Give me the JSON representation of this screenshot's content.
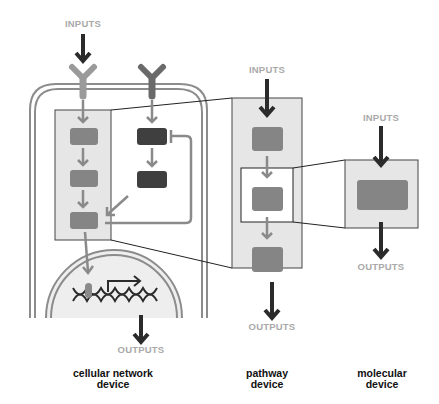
{
  "labels": {
    "cell_inputs": "INPUTS",
    "cell_outputs": "OUTPUTS",
    "pathway_inputs": "INPUTS",
    "pathway_outputs": "OUTPUTS",
    "molecular_inputs": "INPUTS",
    "molecular_outputs": "OUTPUTS"
  },
  "devices": {
    "cellular_line1": "cellular network",
    "cellular_line2": "device",
    "pathway_line1": "pathway",
    "pathway_line2": "device",
    "molecular_line1": "molecular",
    "molecular_line2": "device"
  },
  "colors": {
    "dark_arrow": "#2b2b2b",
    "gray_arrow": "#8a8a8a",
    "membrane": "#8c8c8c",
    "box_fill": "#e6e6e6",
    "node_mid": "#858585",
    "node_dark": "#3f3f3f",
    "io_text": "#a9a9a9"
  }
}
